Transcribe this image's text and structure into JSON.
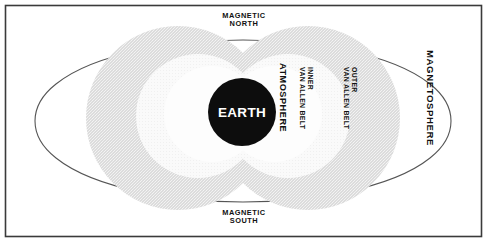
{
  "figure": {
    "title_present": false,
    "background_color": "#ffffff",
    "frame_color": "#3a3a3a",
    "outline_color": "#555555",
    "earth_fill": "#0d0d0d",
    "earth_text_color": "#ffffff",
    "belt_shade_color": "#d8d8d8",
    "atmosphere_fill": "#fbfbfb"
  },
  "labels": {
    "magnetic_north": "MAGNETIC\nNORTH",
    "magnetic_north_line1": "MAGNETIC",
    "magnetic_north_line2": "NORTH",
    "magnetic_south_line1": "MAGNETIC",
    "magnetic_south_line2": "SOUTH",
    "earth": "EARTH",
    "atmosphere": "ATMOSPHERE",
    "inner_belt_line1": "INNER",
    "inner_belt_line2": "VAN ALLEN BELT",
    "outer_belt_line1": "OUTER",
    "outer_belt_line2": "VAN ALLEN BELT",
    "magnetosphere": "MAGNETOSPHERE"
  },
  "diagram_data": {
    "type": "schematic-cross-section",
    "subject": "Earth magnetosphere and Van Allen radiation belts",
    "regions": [
      {
        "name": "EARTH",
        "order": 1,
        "fill": "solid-black"
      },
      {
        "name": "ATMOSPHERE",
        "order": 2,
        "fill": "white"
      },
      {
        "name": "INNER VAN ALLEN BELT",
        "order": 3,
        "fill": "white"
      },
      {
        "name": "OUTER VAN ALLEN BELT",
        "order": 4,
        "fill": "light-gray-stipple"
      },
      {
        "name": "MAGNETOSPHERE",
        "order": 5,
        "fill": "white-outline"
      }
    ],
    "poles": [
      "MAGNETIC NORTH",
      "MAGNETIC SOUTH"
    ]
  }
}
